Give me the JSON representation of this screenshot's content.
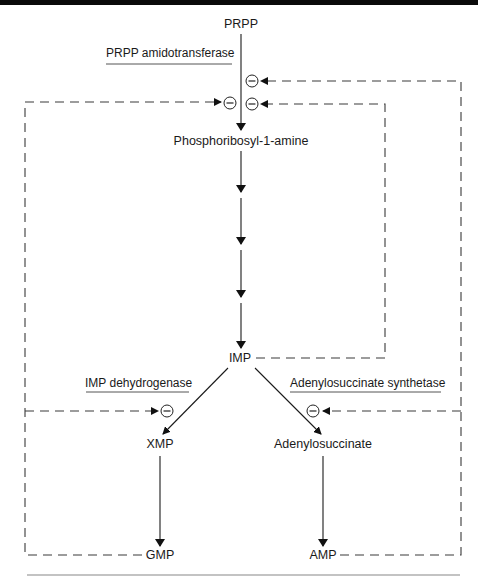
{
  "diagram": {
    "type": "metabolic-pathway",
    "nodes": {
      "prpp": "PRPP",
      "pra": "Phosphoribosyl-1-amine",
      "imp": "IMP",
      "xmp": "XMP",
      "adenylosuccinate": "Adenylosuccinate",
      "gmp": "GMP",
      "amp": "AMP"
    },
    "enzymes": {
      "prpp_amidotransferase": "PRPP amidotransferase",
      "imp_dehydrogenase": "IMP dehydrogenase",
      "adenylosuccinate_synthetase": "Adenylosuccinate synthetase"
    },
    "inhibition_symbol": "⊖",
    "edges": [
      {
        "from": "PRPP",
        "to": "Phosphoribosyl-1-amine",
        "style": "solid",
        "enzyme": "PRPP amidotransferase"
      },
      {
        "from": "Phosphoribosyl-1-amine",
        "to": "IMP",
        "style": "solid",
        "steps": 4
      },
      {
        "from": "IMP",
        "to": "XMP",
        "style": "solid",
        "enzyme": "IMP dehydrogenase"
      },
      {
        "from": "IMP",
        "to": "Adenylosuccinate",
        "style": "solid",
        "enzyme": "Adenylosuccinate synthetase"
      },
      {
        "from": "XMP",
        "to": "GMP",
        "style": "solid"
      },
      {
        "from": "Adenylosuccinate",
        "to": "AMP",
        "style": "solid"
      }
    ],
    "feedback": [
      {
        "from": "GMP",
        "inhibits": "PRPP amidotransferase",
        "style": "dashed"
      },
      {
        "from": "GMP",
        "inhibits": "IMP dehydrogenase",
        "style": "dashed"
      },
      {
        "from": "AMP",
        "inhibits": "PRPP amidotransferase",
        "style": "dashed"
      },
      {
        "from": "AMP",
        "inhibits": "Adenylosuccinate synthetase",
        "style": "dashed"
      },
      {
        "from": "IMP",
        "inhibits": "PRPP amidotransferase",
        "style": "dashed"
      }
    ]
  }
}
